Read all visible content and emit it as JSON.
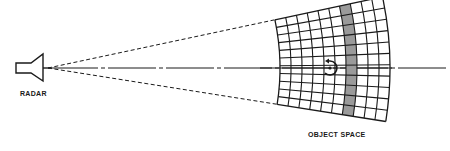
{
  "diagram": {
    "labels": {
      "radar": "RADAR",
      "object_space": "OBJECT SPACE"
    },
    "radar": {
      "icon": "horn-antenna-icon",
      "apex": [
        48,
        68
      ]
    },
    "object_space_grid": {
      "columns": 10,
      "rows": 11,
      "shaded_column_index": 6,
      "shaded_color": "#9a9a9a",
      "inner_radius": 232,
      "outer_radius": 342,
      "half_angle_deg": 10.5
    },
    "target": {
      "icon": "rotating-target-icon",
      "center": [
        330,
        68
      ],
      "radius": 7
    },
    "beam": {
      "style": "dashed",
      "color": "#222222"
    },
    "axis": {
      "style": "dash-dot",
      "end_x": 446
    }
  }
}
